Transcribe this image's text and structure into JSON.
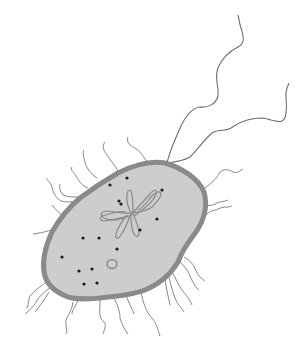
{
  "diagram": {
    "subject": "Bacterium cell illustration",
    "colors": {
      "background": "#ffffff",
      "cytoplasm": "#cdcdcd",
      "cell_wall": "#8a8a8a",
      "appendage_line": "#6e6e6e",
      "ribosome": "#1a1a1a",
      "nucleoid": "#8a8a8a",
      "plasmid": "#8a8a8a"
    },
    "parts": [
      {
        "id": "cell-body",
        "label": "Cell body (cytoplasm)"
      },
      {
        "id": "cell-wall",
        "label": "Cell wall / membrane"
      },
      {
        "id": "flagella",
        "label": "Flagella",
        "count": 2
      },
      {
        "id": "pili",
        "label": "Pili"
      },
      {
        "id": "nucleoid",
        "label": "Nucleoid (DNA)"
      },
      {
        "id": "plasmid",
        "label": "Plasmid"
      },
      {
        "id": "ribosomes",
        "label": "Ribosomes",
        "count": 14
      }
    ],
    "ribosomes": [
      [
        127,
        178
      ],
      [
        162,
        190
      ],
      [
        121,
        203
      ],
      [
        157,
        215
      ],
      [
        105,
        231
      ],
      [
        138,
        233
      ],
      [
        84,
        258
      ],
      [
        116,
        268
      ],
      [
        92,
        272
      ],
      [
        110,
        284
      ],
      [
        128,
        282
      ],
      [
        76,
        283
      ],
      [
        95,
        243
      ],
      [
        140,
        258
      ]
    ]
  }
}
